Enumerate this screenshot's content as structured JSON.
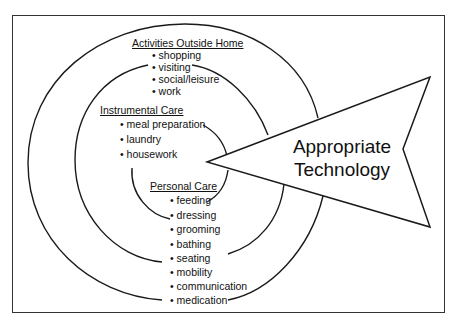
{
  "diagram": {
    "rings": [
      {
        "heading": "Activities Outside Home",
        "items": [
          "shopping",
          "visiting",
          "social/leisure",
          "work"
        ]
      },
      {
        "heading": "Instrumental Care",
        "items": [
          "meal preparation",
          "laundry",
          "housework"
        ]
      },
      {
        "heading": "Personal Care",
        "items": [
          "feeding",
          "dressing",
          "grooming",
          "bathing",
          "seating",
          "mobility",
          "communication",
          "medication"
        ]
      }
    ],
    "arrow": {
      "line1": "Appropriate",
      "line2": "Technology"
    },
    "colors": {
      "stroke": "#1a1a1a",
      "background": "#ffffff"
    }
  }
}
